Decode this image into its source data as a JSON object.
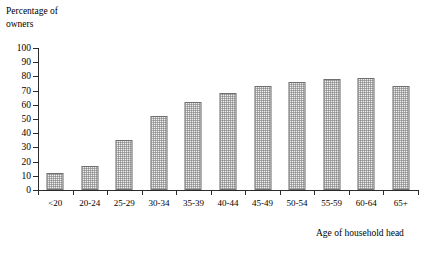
{
  "chart_data": {
    "type": "bar",
    "title": "",
    "ylabel_line1": "Percentage of",
    "ylabel_line2": "owners",
    "xlabel": "Age of household head",
    "categories": [
      "<20",
      "20-24",
      "25-29",
      "30-34",
      "35-39",
      "40-44",
      "45-49",
      "50-54",
      "55-59",
      "60-64",
      "65+"
    ],
    "values": [
      12,
      17,
      35.5,
      52,
      62,
      68.5,
      73,
      76,
      78.5,
      79,
      73.5
    ],
    "ylim": [
      0,
      100
    ],
    "ytick_values": [
      0,
      10,
      20,
      30,
      40,
      50,
      60,
      70,
      80,
      90,
      100
    ],
    "ytick_labels": [
      "0",
      "10",
      "20",
      "30",
      "40",
      "50",
      "60",
      "70",
      "80",
      "90",
      "100"
    ],
    "grid": false,
    "legend": "none",
    "bar_fill_color": "#eeeeee",
    "bar_edge_color": "#6f6f6f",
    "axis_color": "#2b2b2b"
  }
}
